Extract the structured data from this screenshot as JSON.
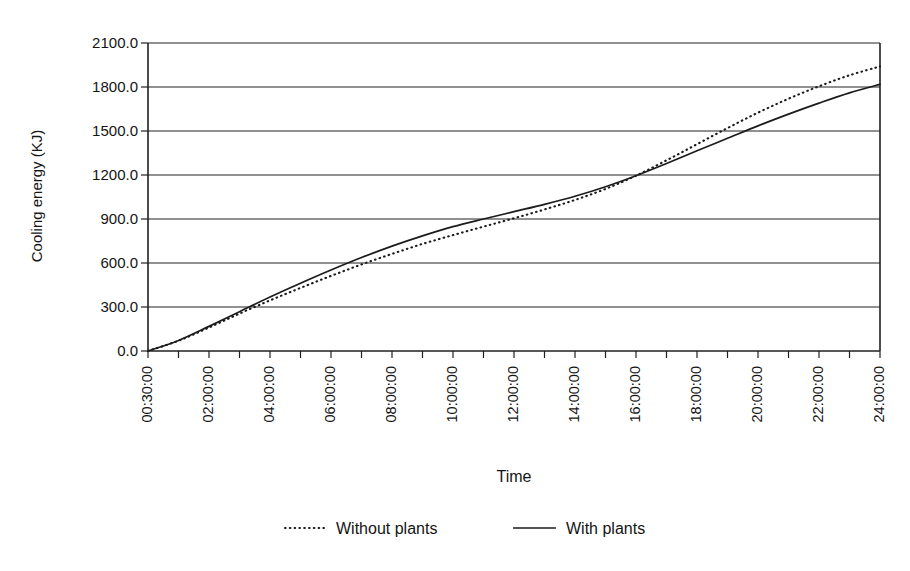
{
  "chart_data": {
    "type": "line",
    "title": "",
    "xlabel": "Time",
    "ylabel": "Cooling energy (KJ)",
    "ylim": [
      0,
      2100
    ],
    "ytick_labels": [
      "2100.0",
      "1800.0",
      "1500.0",
      "1200.0",
      "900.0",
      "600.0",
      "300.0",
      "0.0"
    ],
    "ytick_values": [
      2100,
      1800,
      1500,
      1200,
      900,
      600,
      300,
      0
    ],
    "grid": "horizontal",
    "legend_position": "bottom-center",
    "categories": [
      "00:30:00",
      "01:00:00",
      "02:00:00",
      "03:00:00",
      "04:00:00",
      "05:00:00",
      "06:00:00",
      "07:00:00",
      "08:00:00",
      "09:00:00",
      "10:00:00",
      "11:00:00",
      "12:00:00",
      "13:00:00",
      "14:00:00",
      "15:00:00",
      "16:00:00",
      "17:00:00",
      "18:00:00",
      "19:00:00",
      "20:00:00",
      "21:00:00",
      "22:00:00",
      "23:00:00",
      "24:00:00"
    ],
    "xtick_labels": [
      "00:30:00",
      "02:00:00",
      "04:00:00",
      "06:00:00",
      "08:00:00",
      "10:00:00",
      "12:00:00",
      "14:00:00",
      "16:00:00",
      "18:00:00",
      "20:00:00",
      "22:00:00",
      "24:00:00"
    ],
    "xtick_label_rotation_deg": -90,
    "series": [
      {
        "name": "Without plants",
        "style": "dotted",
        "color": "#1b1b1b",
        "values": [
          0,
          70,
          160,
          255,
          345,
          430,
          512,
          590,
          662,
          730,
          790,
          848,
          905,
          965,
          1030,
          1105,
          1195,
          1300,
          1410,
          1520,
          1625,
          1720,
          1805,
          1880,
          1940
        ]
      },
      {
        "name": "With plants",
        "style": "solid",
        "color": "#1b1b1b",
        "values": [
          0,
          72,
          168,
          268,
          368,
          462,
          552,
          637,
          715,
          785,
          848,
          900,
          950,
          1000,
          1055,
          1120,
          1195,
          1278,
          1365,
          1450,
          1535,
          1615,
          1690,
          1760,
          1818
        ]
      }
    ],
    "annotations": []
  },
  "legend": {
    "entries": [
      {
        "label": "Without plants",
        "marker": "dotted-line-swatch"
      },
      {
        "label": "With plants",
        "marker": "solid-line-swatch"
      }
    ]
  }
}
